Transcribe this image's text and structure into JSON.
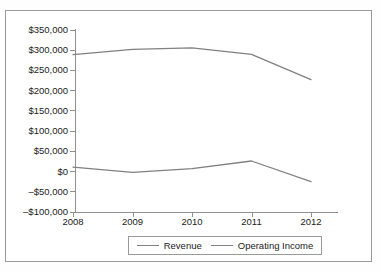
{
  "chart_data": {
    "type": "line",
    "title": "",
    "xlabel": "",
    "ylabel": "",
    "x": [
      "2008",
      "2009",
      "2010",
      "2011",
      "2012"
    ],
    "categories": [
      "2008",
      "2009",
      "2010",
      "2011",
      "2012"
    ],
    "series": [
      {
        "name": "Revenue",
        "values": [
          289000,
          302000,
          306000,
          290000,
          227000
        ],
        "color": "#808080"
      },
      {
        "name": "Operating Income",
        "values": [
          11000,
          -2000,
          7000,
          26000,
          -25000
        ],
        "color": "#808080"
      }
    ],
    "ylim": [
      -100000,
      350000
    ],
    "ytick_values": [
      350000,
      300000,
      250000,
      200000,
      150000,
      100000,
      50000,
      0,
      -50000,
      -100000
    ],
    "ytick_labels": [
      "$350,000",
      "$300,000",
      "$250,000",
      "$200,000",
      "$150,000",
      "$100,000",
      "$50,000",
      "$0",
      "–$50,000",
      "–$100,000"
    ],
    "grid": false,
    "legend_position": "bottom",
    "legend": [
      "Revenue",
      "Operating Income"
    ]
  },
  "legend": {
    "items": [
      {
        "label": "Revenue"
      },
      {
        "label": "Operating Income"
      }
    ]
  },
  "colors": {
    "line": "#808080",
    "axis": "#8f8f8f",
    "border": "#9a9a9a",
    "text": "#1b1b1b",
    "background": "#ffffff"
  }
}
